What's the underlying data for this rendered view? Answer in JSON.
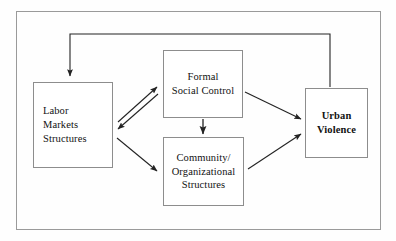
{
  "figure": {
    "type": "flow-diagram",
    "width": 396,
    "height": 241,
    "background_color": "#fefefe",
    "frame": {
      "name": "outer-frame",
      "x": 16,
      "y": 11,
      "width": 365,
      "height": 219,
      "stroke_color": "#9a9a9a",
      "stroke_width": 1
    }
  },
  "nodes": [
    {
      "id": "labor",
      "label": "Labor\nMarkets\nStructures",
      "text_align": "left",
      "bold": false,
      "x": 33,
      "y": 82,
      "width": 80,
      "height": 86
    },
    {
      "id": "formal",
      "label": "Formal\nSocial Control",
      "text_align": "center",
      "bold": false,
      "x": 163,
      "y": 50,
      "width": 80,
      "height": 68
    },
    {
      "id": "community",
      "label": "Community/\nOrganizational\nStructures",
      "text_align": "center",
      "bold": false,
      "x": 163,
      "y": 137,
      "width": 81,
      "height": 69
    },
    {
      "id": "urban",
      "label": "Urban\nViolence",
      "text_align": "center",
      "bold": true,
      "x": 305,
      "y": 88,
      "width": 63,
      "height": 70
    }
  ],
  "edges": [
    {
      "id": "labor-to-formal",
      "from": "labor",
      "to": "formal",
      "kind": "straight",
      "arrowheads": "end",
      "points": [
        [
          118,
          122
        ],
        [
          158,
          86
        ]
      ]
    },
    {
      "id": "formal-to-labor",
      "from": "formal",
      "to": "labor",
      "kind": "straight",
      "arrowheads": "end",
      "points": [
        [
          158,
          94
        ],
        [
          117,
          130
        ]
      ]
    },
    {
      "id": "labor-to-community",
      "from": "labor",
      "to": "community",
      "kind": "straight",
      "arrowheads": "end",
      "points": [
        [
          117,
          138
        ],
        [
          158,
          172
        ]
      ]
    },
    {
      "id": "formal-to-community",
      "from": "formal",
      "to": "community",
      "kind": "straight",
      "arrowheads": "end",
      "points": [
        [
          203,
          119
        ],
        [
          203,
          135
        ]
      ]
    },
    {
      "id": "formal-to-urban",
      "from": "formal",
      "to": "urban",
      "kind": "straight",
      "arrowheads": "end",
      "points": [
        [
          245,
          92
        ],
        [
          302,
          120
        ]
      ]
    },
    {
      "id": "community-to-urban",
      "from": "community",
      "to": "urban",
      "kind": "straight",
      "arrowheads": "end",
      "points": [
        [
          248,
          168
        ],
        [
          302,
          133
        ]
      ]
    },
    {
      "id": "urban-feedback-to-labor",
      "from": "urban",
      "to": "labor",
      "kind": "orthogonal",
      "arrowheads": "end",
      "points": [
        [
          330,
          87
        ],
        [
          330,
          34
        ],
        [
          70,
          34
        ],
        [
          70,
          79
        ]
      ]
    }
  ],
  "style": {
    "box_stroke_color": "#8d8d8d",
    "arrow_color": "#232323",
    "text_color": "#121212"
  }
}
